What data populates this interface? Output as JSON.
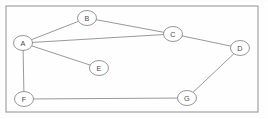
{
  "diagram": {
    "type": "node-link-graph",
    "canvas": {
      "width": 268,
      "height": 119,
      "background": "#fefefe"
    },
    "frame": {
      "x": 6,
      "y": 6,
      "width": 252,
      "height": 106,
      "stroke": "#9a9a9a"
    },
    "style": {
      "edge_color": "#8d8d8d",
      "node_fill": "#ffffff",
      "node_stroke": "#8a8a8a",
      "label_color": "#4a4a4a",
      "node_rx": 9.5,
      "node_ry": 7.5
    },
    "nodes": [
      {
        "id": "A",
        "label": "A",
        "cx": 23,
        "cy": 43
      },
      {
        "id": "B",
        "label": "B",
        "cx": 87,
        "cy": 18
      },
      {
        "id": "C",
        "label": "C",
        "cx": 173,
        "cy": 34
      },
      {
        "id": "D",
        "label": "D",
        "cx": 240,
        "cy": 48
      },
      {
        "id": "E",
        "label": "E",
        "cx": 99,
        "cy": 68
      },
      {
        "id": "F",
        "label": "F",
        "cx": 24,
        "cy": 99
      },
      {
        "id": "G",
        "label": "G",
        "cx": 187,
        "cy": 98
      }
    ],
    "edges": [
      {
        "from": "A",
        "to": "B"
      },
      {
        "from": "A",
        "to": "C"
      },
      {
        "from": "A",
        "to": "E"
      },
      {
        "from": "A",
        "to": "F"
      },
      {
        "from": "B",
        "to": "C"
      },
      {
        "from": "C",
        "to": "D"
      },
      {
        "from": "D",
        "to": "G"
      },
      {
        "from": "F",
        "to": "G"
      }
    ]
  }
}
